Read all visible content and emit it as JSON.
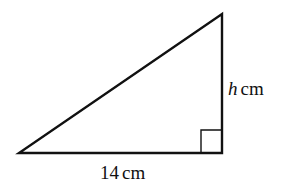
{
  "diagram": {
    "type": "right-triangle",
    "base_label": {
      "value": "14",
      "unit": "cm"
    },
    "height_label": {
      "variable": "h",
      "unit": "cm"
    },
    "right_angle_marker": true,
    "stroke_color": "#111111",
    "background": "#ffffff"
  }
}
